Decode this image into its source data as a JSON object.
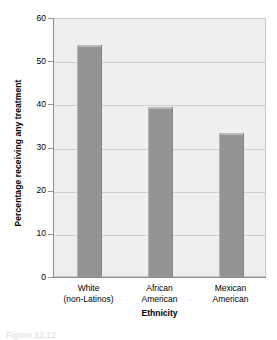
{
  "chart_data": {
    "type": "bar",
    "title": "",
    "categories": [
      "White (non-Latinos)",
      "African American",
      "Mexican American"
    ],
    "category_lines": [
      {
        "line1": "White",
        "line2": "(non-Latinos)"
      },
      {
        "line1": "African",
        "line2": "American"
      },
      {
        "line1": "Mexican",
        "line2": "American"
      }
    ],
    "values": [
      54,
      39.5,
      33.5
    ],
    "xlabel": "Ethnicity",
    "ylabel": "Percentage receiving any treatment",
    "ylim": [
      0,
      60
    ],
    "ytick_values": [
      0,
      10,
      20,
      30,
      40,
      50,
      60
    ],
    "yticks": [
      "0",
      "10",
      "20",
      "30",
      "40",
      "50",
      "60"
    ],
    "grid": true,
    "legend": "none",
    "bar_color": "#949494",
    "plot_background": "#efefef",
    "gridline_color": "#cfcfcf"
  },
  "figure": {
    "caption": "Figure 12.12"
  }
}
